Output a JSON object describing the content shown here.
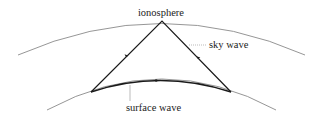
{
  "diagram": {
    "labels": {
      "ionosphere": "ionosphere",
      "sky_wave": "sky wave",
      "surface_wave": "surface wave"
    },
    "colors": {
      "layer": "#8a8a8a",
      "path": "#1a1a1a",
      "leader": "#aaaaaa",
      "text": "#222222"
    }
  }
}
